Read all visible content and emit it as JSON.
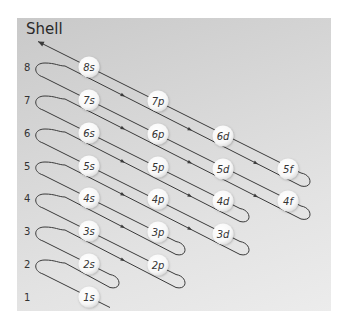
{
  "title": "Shell",
  "colors": {
    "panel_top": "#c9c9c9",
    "panel_bottom": "#ececec",
    "line": "#3a3a3a",
    "orbital_fill": "#ffffff",
    "text": "#333333"
  },
  "shells": [
    {
      "n": 1,
      "label": "1",
      "y": 297
    },
    {
      "n": 2,
      "label": "2",
      "y": 264
    },
    {
      "n": 3,
      "label": "3",
      "y": 231
    },
    {
      "n": 4,
      "label": "4",
      "y": 198
    },
    {
      "n": 5,
      "label": "5",
      "y": 166
    },
    {
      "n": 6,
      "label": "6",
      "y": 133
    },
    {
      "n": 7,
      "label": "7",
      "y": 100
    },
    {
      "n": 8,
      "label": "8",
      "y": 67
    }
  ],
  "subshell_columns": {
    "s": 89,
    "p": 158,
    "d": 223,
    "f": 288
  },
  "orbitals": [
    {
      "label": "1s",
      "n": 1,
      "sub": "s"
    },
    {
      "label": "2s",
      "n": 2,
      "sub": "s"
    },
    {
      "label": "2p",
      "n": 2,
      "sub": "p"
    },
    {
      "label": "3s",
      "n": 3,
      "sub": "s"
    },
    {
      "label": "3p",
      "n": 3,
      "sub": "p"
    },
    {
      "label": "3d",
      "n": 3,
      "sub": "d"
    },
    {
      "label": "4s",
      "n": 4,
      "sub": "s"
    },
    {
      "label": "4p",
      "n": 4,
      "sub": "p"
    },
    {
      "label": "4d",
      "n": 4,
      "sub": "d"
    },
    {
      "label": "4f",
      "n": 4,
      "sub": "f"
    },
    {
      "label": "5s",
      "n": 5,
      "sub": "s"
    },
    {
      "label": "5p",
      "n": 5,
      "sub": "p"
    },
    {
      "label": "5d",
      "n": 5,
      "sub": "d"
    },
    {
      "label": "5f",
      "n": 5,
      "sub": "f"
    },
    {
      "label": "6s",
      "n": 6,
      "sub": "s"
    },
    {
      "label": "6p",
      "n": 6,
      "sub": "p"
    },
    {
      "label": "6d",
      "n": 6,
      "sub": "d"
    },
    {
      "label": "7s",
      "n": 7,
      "sub": "s"
    },
    {
      "label": "7p",
      "n": 7,
      "sub": "p"
    },
    {
      "label": "8s",
      "n": 8,
      "sub": "s"
    }
  ],
  "filling_order": [
    "1s",
    "2s",
    "2p",
    "3s",
    "3p",
    "4s",
    "3d",
    "4p",
    "5s",
    "4d",
    "5p",
    "6s",
    "4f",
    "5d",
    "6p",
    "7s",
    "5f",
    "6d",
    "7p",
    "8s"
  ],
  "diagonals": [
    {
      "k": 1,
      "right_loop_x": null
    },
    {
      "k": 2,
      "right_loop_x": 117
    },
    {
      "k": 3,
      "right_loop_x": 183
    },
    {
      "k": 4,
      "right_loop_x": 183
    },
    {
      "k": 5,
      "right_loop_x": 247
    },
    {
      "k": 6,
      "right_loop_x": 247
    },
    {
      "k": 7,
      "right_loop_x": 308
    },
    {
      "k": 8,
      "right_loop_x": 308
    }
  ],
  "arrow_marks_x": [
    64,
    123,
    190,
    256
  ]
}
